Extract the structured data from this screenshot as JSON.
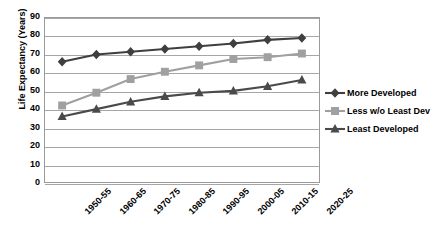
{
  "chart_data": {
    "type": "line",
    "title": "",
    "xlabel": "",
    "ylabel": "Life Expectancy (Years)",
    "categories": [
      "1950-55",
      "1960-65",
      "1970-75",
      "1980-85",
      "1990-95",
      "2000-05",
      "2010-15",
      "2020-25"
    ],
    "ylim": [
      0,
      90
    ],
    "ytick_step": 10,
    "yticks": [
      "90",
      "80",
      "70",
      "60",
      "50",
      "40",
      "30",
      "20",
      "10",
      "0"
    ],
    "grid": true,
    "legend_position": "right",
    "series": [
      {
        "name": "More Developed",
        "marker": "diamond",
        "color": "#3f3f3f",
        "values": [
          66,
          70,
          71.5,
          73,
          74.5,
          76,
          78,
          79
        ]
      },
      {
        "name": "Less w/o Least Dev",
        "marker": "square",
        "color": "#a0a0a0",
        "values": [
          42,
          49,
          56.5,
          60.5,
          64,
          67.5,
          68.5,
          70.5
        ]
      },
      {
        "name": "Least Developed",
        "marker": "triangle",
        "color": "#4a4a4a",
        "values": [
          36,
          40,
          44,
          47,
          49,
          50,
          52.5,
          56
        ]
      }
    ]
  },
  "legend": {
    "items": [
      {
        "label": "More Developed"
      },
      {
        "label": "Less w/o Least Dev"
      },
      {
        "label": "Least Developed"
      }
    ]
  },
  "colors": {
    "series_more_developed": "#3f3f3f",
    "series_less_without_least": "#a0a0a0",
    "series_least_developed": "#4a4a4a",
    "gridline": "#a6a6a6",
    "frame": "#9a9a9a",
    "text": "#000000",
    "background": "#ffffff"
  }
}
